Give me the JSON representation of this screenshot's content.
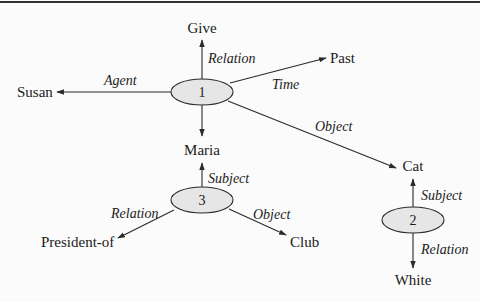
{
  "diagram": {
    "type": "semantic-network",
    "nodes": {
      "n1": {
        "label": "1"
      },
      "n2": {
        "label": "2"
      },
      "n3": {
        "label": "3"
      }
    },
    "concepts": {
      "give": "Give",
      "susan": "Susan",
      "past": "Past",
      "maria": "Maria",
      "cat": "Cat",
      "president_of": "President-of",
      "club": "Club",
      "white": "White"
    },
    "edges": {
      "n1_give": "Relation",
      "n1_susan": "Agent",
      "n1_past": "Time",
      "n1_cat": "Object",
      "n3_maria": "Subject",
      "n3_president": "Relation",
      "n3_club": "Object",
      "n2_cat": "Subject",
      "n2_white": "Relation"
    }
  }
}
